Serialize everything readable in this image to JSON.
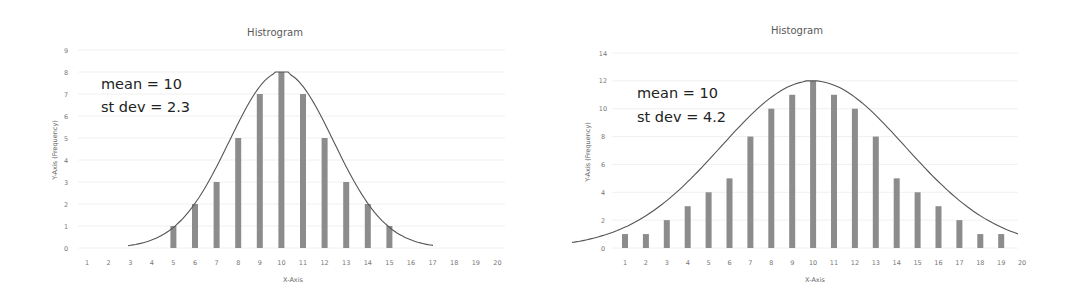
{
  "chart_data": [
    {
      "type": "bar",
      "title": "Histrogram",
      "xlabel": "X-Axis",
      "ylabel": "Y-Axis (Frequency)",
      "categories": [
        1,
        2,
        3,
        4,
        5,
        6,
        7,
        8,
        9,
        10,
        11,
        12,
        13,
        14,
        15,
        16,
        17,
        18,
        19,
        20
      ],
      "values": [
        0,
        0,
        0,
        0,
        1,
        2,
        3,
        5,
        7,
        8,
        7,
        5,
        3,
        2,
        1,
        0,
        0,
        0,
        0,
        0
      ],
      "ylim": [
        0,
        9
      ],
      "yticks": [
        0,
        1,
        2,
        3,
        4,
        5,
        6,
        7,
        8,
        9
      ],
      "grid": true,
      "overlay": "normal curve",
      "annotations": [
        "mean = 10",
        "st dev = 2.3"
      ],
      "mean": 10,
      "st_dev": 2.3
    },
    {
      "type": "bar",
      "title": "Histogram",
      "xlabel": "X-Axis",
      "ylabel": "Y-Axis (Frequency)",
      "categories": [
        1,
        2,
        3,
        4,
        5,
        6,
        7,
        8,
        9,
        10,
        11,
        12,
        13,
        14,
        15,
        16,
        17,
        18,
        19,
        20
      ],
      "values": [
        1,
        1,
        2,
        3,
        4,
        5,
        8,
        10,
        11,
        12,
        11,
        10,
        8,
        5,
        4,
        3,
        2,
        1,
        1,
        0
      ],
      "ylim": [
        0,
        14
      ],
      "yticks": [
        0,
        2,
        4,
        6,
        8,
        10,
        12,
        14
      ],
      "grid": true,
      "overlay": "normal curve",
      "annotations": [
        "mean = 10",
        "st dev = 4.2"
      ],
      "mean": 10,
      "st_dev": 4.2
    }
  ],
  "charts": [
    {
      "title": "Histrogram",
      "xlabel": "X-Axis",
      "ylabel": "Y-Axis (Frequency)",
      "annot1": "mean = 10",
      "annot2": "st dev = 2.3"
    },
    {
      "title": "Histogram",
      "xlabel": "X-Axis",
      "ylabel": "Y-Axis (Frequency)",
      "annot1": "mean = 10",
      "annot2": "st dev = 4.2"
    }
  ]
}
